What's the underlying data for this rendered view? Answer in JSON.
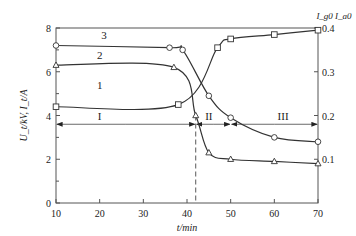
{
  "chart_data": {
    "type": "line",
    "title": "",
    "xlabel": "t/min",
    "ylabel": "U_t/kV, I_t/A",
    "ylabel_right": "I_g0 I_a0",
    "xlim": [
      10,
      70
    ],
    "ylim": [
      0,
      8
    ],
    "ylim_right": [
      0,
      0.4
    ],
    "x_ticks": [
      10,
      20,
      30,
      40,
      50,
      60,
      70
    ],
    "y_ticks": [
      0,
      2,
      4,
      6,
      8
    ],
    "y_ticks_right": [
      0.1,
      0.2,
      0.3,
      0.4
    ],
    "grid": false,
    "series": [
      {
        "name": "1",
        "marker": "square",
        "x": [
          10,
          38,
          47,
          50,
          60,
          70
        ],
        "values": [
          4.4,
          4.5,
          7.1,
          7.5,
          7.7,
          7.9
        ]
      },
      {
        "name": "2",
        "marker": "triangle",
        "x": [
          10,
          37,
          42,
          45,
          50,
          60,
          70
        ],
        "values": [
          6.3,
          6.2,
          4.0,
          2.3,
          2.0,
          1.9,
          1.8
        ]
      },
      {
        "name": "3",
        "marker": "circle",
        "x": [
          10,
          36,
          39,
          45,
          50,
          60,
          70
        ],
        "values": [
          7.2,
          7.1,
          7.0,
          4.9,
          3.9,
          3.0,
          2.8
        ]
      }
    ],
    "annotations": {
      "stage_labels": [
        "I",
        "II",
        "III"
      ],
      "stage_boundaries_x": [
        10,
        42,
        50,
        70
      ],
      "stage_arrow_y": 3.6,
      "dashed_vline_x": 42
    }
  }
}
